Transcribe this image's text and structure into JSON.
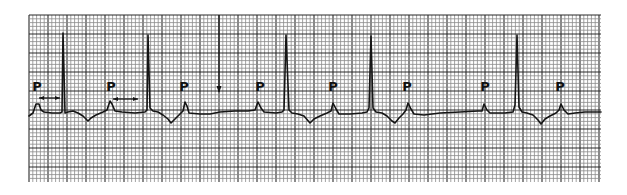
{
  "figure": {
    "type": "ecg-rhythm-strip",
    "colors": {
      "paper": "#ffffff",
      "grid_minor": "#8a8a8a",
      "grid_major": "#2a2a2a",
      "trace": "#151515"
    }
  },
  "labels": {
    "p_wave": "P"
  },
  "annotations": {
    "p_waves": [
      {
        "label": "P",
        "beat": 1
      },
      {
        "label": "P",
        "beat": 2
      },
      {
        "label": "P",
        "beat": 3
      },
      {
        "label": "P",
        "beat": 4
      },
      {
        "label": "P",
        "beat": 5
      },
      {
        "label": "P",
        "beat": 6
      },
      {
        "label": "P",
        "beat": 7
      },
      {
        "label": "P",
        "beat": 8
      }
    ],
    "pr_interval_markers": 2,
    "dropped_beat_arrow": 1
  },
  "rhythm": {
    "p_wave_count": 8,
    "qrs_count": 5,
    "conducted_p_indices": [
      1,
      2,
      5,
      6,
      8
    ],
    "blocked_p_indices": [
      3,
      4,
      7
    ]
  }
}
